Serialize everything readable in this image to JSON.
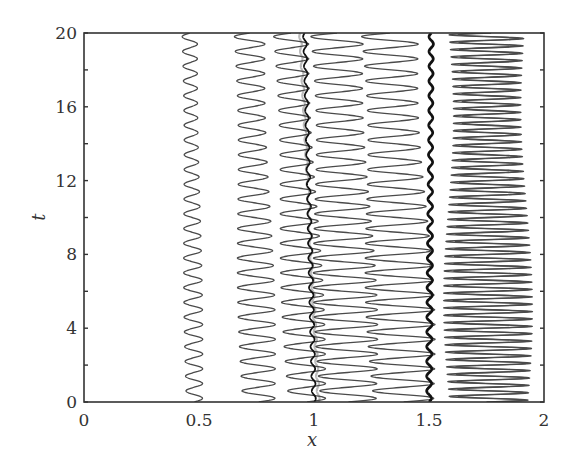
{
  "chart_data": {
    "type": "line",
    "title": "",
    "xlabel": "x",
    "ylabel": "t",
    "xlim": [
      0,
      2
    ],
    "ylim": [
      0,
      20
    ],
    "xticks": [
      0,
      0.5,
      1,
      1.5,
      2
    ],
    "xtick_labels": [
      "0",
      "0.5",
      "1",
      "1.5",
      "2"
    ],
    "yticks": [
      0,
      4,
      8,
      12,
      16,
      20
    ],
    "ytick_labels": [
      "0",
      "4",
      "8",
      "12",
      "16",
      "20"
    ],
    "y_minor_ticks": [
      2,
      6,
      10,
      14,
      18
    ],
    "grid": false,
    "legend": null,
    "series": [
      {
        "name": "trajectory-1",
        "center_start": 0.48,
        "center_end": 0.46,
        "amplitude": 0.035,
        "period": 0.8,
        "style": "thin"
      },
      {
        "name": "trajectory-2",
        "center_start": 0.76,
        "center_end": 0.72,
        "amplitude": 0.07,
        "period": 0.8,
        "style": "thin"
      },
      {
        "name": "trajectory-3",
        "center_start": 0.97,
        "center_end": 0.9,
        "amplitude": 0.08,
        "period": 0.8,
        "style": "thin"
      },
      {
        "name": "trajectory-4",
        "center_start": 1.15,
        "center_end": 1.1,
        "amplitude": 0.12,
        "period": 0.8,
        "style": "thin"
      },
      {
        "name": "trajectory-5",
        "center_start": 1.39,
        "center_end": 1.33,
        "amplitude": 0.13,
        "period": 0.8,
        "style": "thin"
      },
      {
        "name": "trajectory-6",
        "center_start": 1.75,
        "center_end": 1.74,
        "amplitude": 0.16,
        "period": 0.4,
        "style": "thin"
      },
      {
        "name": "trajectory-7",
        "center_start": 1.78,
        "center_end": 1.77,
        "amplitude": 0.15,
        "period": 0.4,
        "style": "thin"
      },
      {
        "name": "front-near-1",
        "center_start": 1.0,
        "center_end": 0.96,
        "amplitude": 0.008,
        "period": 0.8,
        "style": "thick"
      },
      {
        "name": "front-grey",
        "center_start": 1.02,
        "center_end": 0.94,
        "amplitude": 0.005,
        "period": 0.8,
        "style": "grey"
      },
      {
        "name": "front-near-1.5",
        "center_start": 1.5,
        "center_end": 1.51,
        "amplitude": 0.01,
        "period": 0.8,
        "style": "bold"
      }
    ]
  }
}
